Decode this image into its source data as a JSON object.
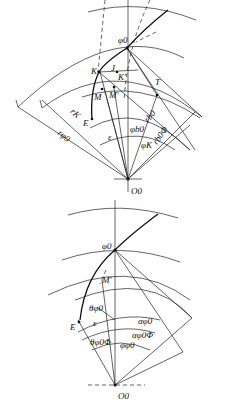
{
  "figure": {
    "top_diagram": {
      "labels": {
        "phi0": "φ0",
        "K": "K",
        "J": "J",
        "K_prime": "K'",
        "M": "M",
        "M_prime": "M'",
        "T": "T",
        "E": "E",
        "r_phi0": "rφ0",
        "r_K": "rK",
        "phi_b0": "φb0",
        "r_b0": "rb0",
        "r_b0phi": "rb0Φ",
        "epsilon": "ε",
        "phi_K": "φK",
        "O0": "O0"
      }
    },
    "bottom_diagram": {
      "labels": {
        "phi0": "φ0",
        "M_prime": "M'",
        "theta_phi0": "θφ0",
        "E": "E",
        "epsilon": "ε",
        "alpha_phi0": "αφ0",
        "alpha_phi0phi": "αφ0Φ",
        "theta_phi0phi": "θφ0Φ",
        "phi_phi0": "φφ0",
        "O0": "O0"
      }
    }
  }
}
